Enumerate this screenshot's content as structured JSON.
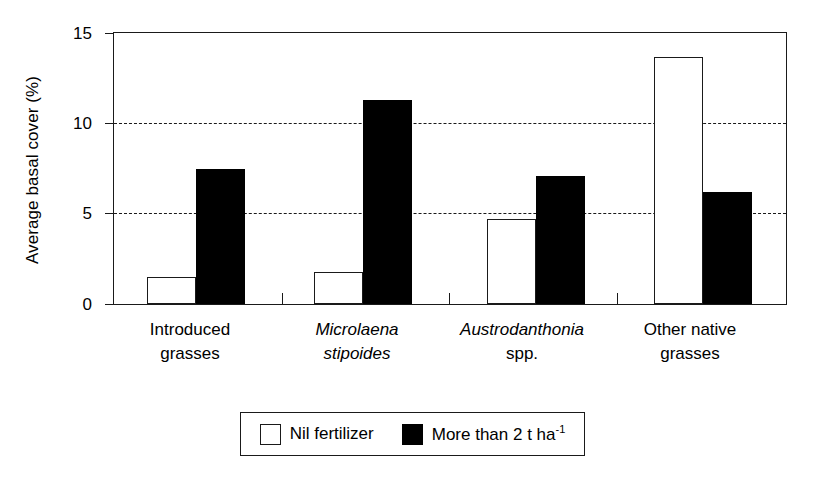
{
  "chart_data": {
    "type": "bar",
    "title": "",
    "xlabel": "",
    "ylabel": "Average basal cover (%)",
    "ylim": [
      0,
      15
    ],
    "yticks": [
      0,
      5,
      10,
      15
    ],
    "ytick_labels": [
      "0",
      "5",
      "10",
      "15"
    ],
    "gridlines": [
      5,
      10
    ],
    "grid": "horizontal dashed at 5 and 10",
    "legend_position": "bottom-center",
    "categories": [
      "Introduced grasses",
      "Microlaena stipoides",
      "Austrodanthonia spp.",
      "Other native grasses"
    ],
    "category_lines": [
      [
        "Introduced",
        "grasses"
      ],
      [
        "Microlaena",
        "stipoides"
      ],
      [
        "Austrodanthonia",
        "spp."
      ],
      [
        "Other native",
        "grasses"
      ]
    ],
    "series": [
      {
        "name": "Nil fertilizer",
        "color": "#ffffff",
        "edge": "#1a1a1a",
        "values": [
          1.5,
          1.8,
          4.7,
          13.7
        ]
      },
      {
        "name": "More than 2 t ha-1",
        "color": "#000000",
        "edge": "#000000",
        "values": [
          7.5,
          11.3,
          7.1,
          6.2
        ]
      }
    ]
  },
  "axis": {
    "ylabel": "Average basal cover (%)",
    "ytick_15": "15",
    "ytick_10": "10",
    "ytick_5": "5",
    "ytick_0": "0"
  },
  "groups": [
    {
      "line1": "Introduced",
      "line2": "grasses",
      "line1_italic": false,
      "line2_italic": false
    },
    {
      "line1": "Microlaena",
      "line2": "stipoides",
      "line1_italic": true,
      "line2_italic": true
    },
    {
      "line1": "Austrodanthonia",
      "line2": "spp.",
      "line1_italic": true,
      "line2_italic": false
    },
    {
      "line1": "Other native",
      "line2": "grasses",
      "line1_italic": false,
      "line2_italic": false
    }
  ],
  "legend": {
    "items": [
      {
        "label": "Nil fertilizer",
        "swatch": "white-square"
      },
      {
        "label_main": "More than 2 t ha",
        "label_sup": "-1",
        "swatch": "black-square"
      }
    ]
  }
}
